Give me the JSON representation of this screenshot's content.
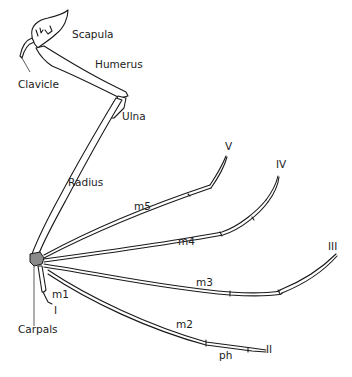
{
  "colors": {
    "line": "#1a1a1a",
    "carpals_fill": "#8a8a8a",
    "label": "#222222",
    "background": "#ffffff"
  },
  "labels": {
    "scapula": "Scapula",
    "humerus": "Humerus",
    "clavicle": "Clavicle",
    "ulna": "Ulna",
    "radius": "Radius",
    "carpals": "Carpals",
    "m1": "m1",
    "m2": "m2",
    "m3": "m3",
    "m4": "m4",
    "m5": "m5",
    "ph": "ph",
    "digit_1": "I",
    "digit_2": "II",
    "digit_3": "III",
    "digit_4": "IV",
    "digit_5": "V"
  }
}
